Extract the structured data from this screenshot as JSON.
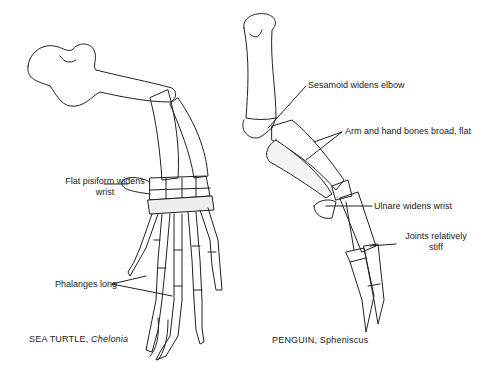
{
  "figures": [
    {
      "id": "sea-turtle",
      "caption_common": "SEA TURTLE,",
      "caption_genus": "Chelonia",
      "labels": [
        {
          "line1": "Flat pisiform widens",
          "line2": "wrist"
        },
        {
          "line1": "Phalanges long"
        }
      ]
    },
    {
      "id": "penguin",
      "caption_common": "PENGUIN,",
      "caption_genus": "Spheniscus",
      "labels": [
        {
          "line1": "Sesamoid widens elbow"
        },
        {
          "line1": "Arm and hand bones broad, flat"
        },
        {
          "line1": "Ulnare widens wrist"
        },
        {
          "line1": "Joints relatively",
          "line2": "stiff"
        }
      ]
    }
  ],
  "colors": {
    "ink": "#222222",
    "shade": "#bbbbbb",
    "background": "#ffffff"
  }
}
